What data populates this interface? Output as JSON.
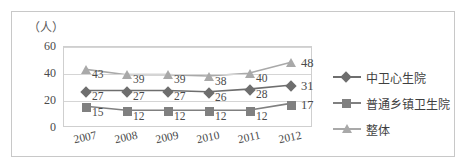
{
  "chart_data": {
    "type": "line",
    "title": "",
    "unit_label": "（人）",
    "xlabel": "",
    "ylabel": "",
    "categories": [
      "2007",
      "2008",
      "2009",
      "2010",
      "2011",
      "2012"
    ],
    "ylim": [
      0,
      60
    ],
    "yticks": [
      0,
      20,
      40,
      60
    ],
    "grid": true,
    "legend_position": "right",
    "series": [
      {
        "name": "中卫心生院",
        "marker": "diamond",
        "color": "#6e6e6e",
        "values": [
          27,
          27,
          27,
          26,
          28,
          31
        ],
        "labels": [
          "27",
          "27",
          "27",
          "26",
          "28",
          "31"
        ]
      },
      {
        "name": "普通乡镇卫生院",
        "marker": "square",
        "color": "#808080",
        "values": [
          15,
          12,
          12,
          12,
          12,
          17
        ],
        "labels": [
          "15",
          "12",
          "12",
          "12",
          "12",
          "17"
        ]
      },
      {
        "name": "整体",
        "marker": "triangle",
        "color": "#a9a9a9",
        "values": [
          43,
          39,
          39,
          38,
          40,
          48
        ],
        "labels": [
          "43",
          "39",
          "39",
          "38",
          "40",
          "48"
        ]
      }
    ]
  }
}
